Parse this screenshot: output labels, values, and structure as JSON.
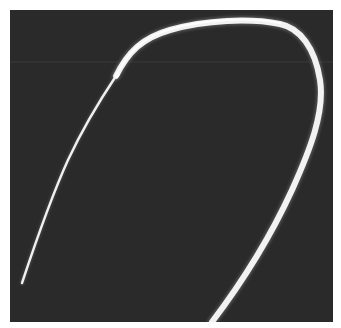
{
  "image": {
    "alt": "Photograph of a white curved catheter with a thin guidewire tip on a dark gray background",
    "background_color": "#2a2a2a",
    "frame_color": "#ffffff",
    "object_color": "#f4f4f4",
    "scanline_color": "#4a4640"
  }
}
